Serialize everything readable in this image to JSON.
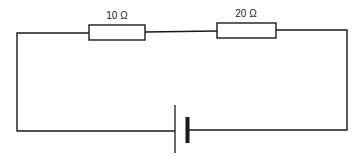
{
  "diagram": {
    "type": "series-circuit",
    "colors": {
      "wire": "#1a1a1a",
      "background": "#ffffff"
    },
    "resistors": [
      {
        "id": "r1",
        "label": "10 Ω"
      },
      {
        "id": "r2",
        "label": "20 Ω"
      }
    ],
    "battery": {
      "cells": 1
    }
  }
}
